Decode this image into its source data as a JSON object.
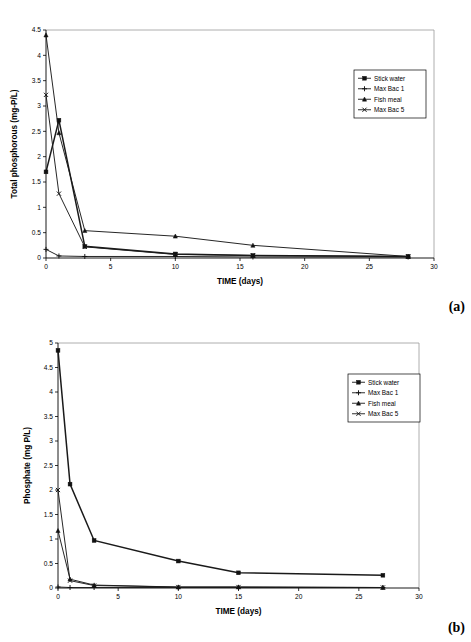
{
  "document": {
    "kind": "two-panel scientific line chart figure"
  },
  "figures": [
    {
      "id": "a",
      "panel_label": "(a)",
      "chart_data": {
        "type": "line",
        "title": "",
        "xlabel": "TIME (days)",
        "ylabel": "Total phosphorous (mg-P/L)",
        "xlim": [
          0,
          30
        ],
        "ylim": [
          0,
          4.5
        ],
        "xticks": [
          0,
          5,
          10,
          15,
          20,
          25,
          30
        ],
        "xtick_labels": [
          "0",
          "5",
          "10",
          "15",
          "20",
          "25",
          "30"
        ],
        "yticks": [
          0,
          0.5,
          1,
          1.5,
          2,
          2.5,
          3,
          3.5,
          4,
          4.5
        ],
        "ytick_labels": [
          "0",
          "0.5",
          "1",
          "1.5",
          "2",
          "2.5",
          "3",
          "3.5",
          "4",
          "4.5"
        ],
        "grid": false,
        "legend_position": "upper right",
        "x": [
          0,
          1,
          3,
          10,
          16,
          28
        ],
        "series": [
          {
            "name": "Stick water",
            "marker": "square",
            "values": [
              1.7,
              2.72,
              0.23,
              0.08,
              0.05,
              0.03
            ]
          },
          {
            "name": "Max Bac 1",
            "marker": "plus",
            "values": [
              0.17,
              0.04,
              0.03,
              0.03,
              0.02,
              0.02
            ]
          },
          {
            "name": "Fish meal",
            "marker": "triangle",
            "values": [
              4.4,
              2.47,
              0.54,
              0.43,
              0.25,
              0.03
            ]
          },
          {
            "name": "Max Bac 5",
            "marker": "cross",
            "values": [
              3.22,
              1.27,
              0.22,
              0.07,
              0.05,
              0.03
            ]
          }
        ]
      }
    },
    {
      "id": "b",
      "panel_label": "(b)",
      "chart_data": {
        "type": "line",
        "title": "",
        "xlabel": "TIME (days)",
        "ylabel": "Phosphate (mg P/L)",
        "xlim": [
          0,
          30
        ],
        "ylim": [
          0,
          5
        ],
        "xticks": [
          0,
          5,
          10,
          15,
          20,
          25,
          30
        ],
        "xtick_labels": [
          "0",
          "5",
          "10",
          "15",
          "20",
          "25",
          "30"
        ],
        "yticks": [
          0,
          0.5,
          1,
          1.5,
          2,
          2.5,
          3,
          3.5,
          4,
          4.5,
          5
        ],
        "ytick_labels": [
          "0",
          "0.5",
          "1",
          "1.5",
          "2",
          "2.5",
          "3",
          "3.5",
          "4",
          "4.5",
          "5"
        ],
        "grid": false,
        "legend_position": "upper right",
        "x": [
          0,
          1,
          3,
          10,
          15,
          27
        ],
        "series": [
          {
            "name": "Stick water",
            "marker": "square",
            "values": [
              4.85,
              2.12,
              0.97,
              0.55,
              0.31,
              0.26
            ]
          },
          {
            "name": "Max Bac 1",
            "marker": "plus",
            "values": [
              0.02,
              0.01,
              0.01,
              0.01,
              0.01,
              0.01
            ]
          },
          {
            "name": "Fish meal",
            "marker": "triangle",
            "values": [
              1.17,
              0.18,
              0.06,
              0.02,
              0.02,
              0.01
            ]
          },
          {
            "name": "Max Bac 5",
            "marker": "cross",
            "values": [
              2.0,
              0.15,
              0.05,
              0.02,
              0.02,
              0.01
            ]
          }
        ]
      }
    }
  ]
}
